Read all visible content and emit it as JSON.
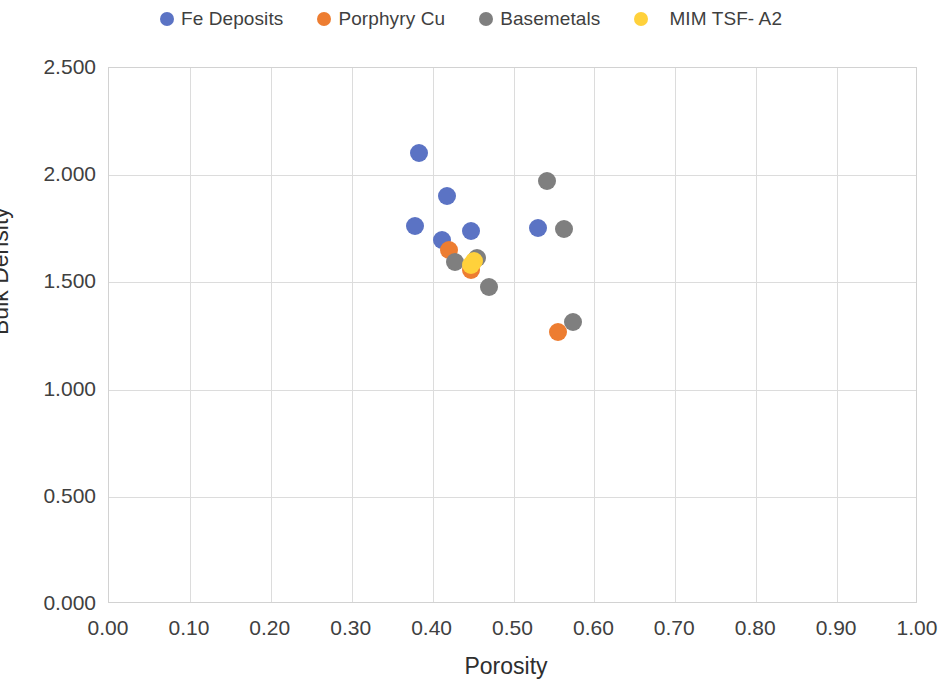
{
  "chart_data": {
    "type": "scatter",
    "title": "",
    "xlabel": "Porosity",
    "ylabel": "Bulk Density",
    "xlim": [
      0.0,
      1.0
    ],
    "ylim": [
      0.0,
      2.5
    ],
    "xticks": [
      "0.00",
      "0.10",
      "0.20",
      "0.30",
      "0.40",
      "0.50",
      "0.60",
      "0.70",
      "0.80",
      "0.90",
      "1.00"
    ],
    "yticks": [
      "0.000",
      "0.500",
      "1.000",
      "1.500",
      "2.000",
      "2.500"
    ],
    "xtick_values": [
      0.0,
      0.1,
      0.2,
      0.3,
      0.4,
      0.5,
      0.6,
      0.7,
      0.8,
      0.9,
      1.0
    ],
    "ytick_values": [
      0.0,
      0.5,
      1.0,
      1.5,
      2.0,
      2.5
    ],
    "grid": true,
    "legend_position": "top",
    "marker_size_px": 18,
    "series": [
      {
        "name": "Fe Deposits",
        "color": "#5B73C4",
        "points": [
          {
            "x": 0.383,
            "y": 2.105
          },
          {
            "x": 0.418,
            "y": 1.905
          },
          {
            "x": 0.378,
            "y": 1.765
          },
          {
            "x": 0.448,
            "y": 1.74
          },
          {
            "x": 0.412,
            "y": 1.7
          },
          {
            "x": 0.53,
            "y": 1.755
          }
        ]
      },
      {
        "name": "Porphyry Cu",
        "color": "#ED7D31",
        "points": [
          {
            "x": 0.42,
            "y": 1.65
          },
          {
            "x": 0.448,
            "y": 1.56
          },
          {
            "x": 0.555,
            "y": 1.27
          }
        ]
      },
      {
        "name": "Basemetals",
        "color": "#7F7F7F",
        "points": [
          {
            "x": 0.542,
            "y": 1.975
          },
          {
            "x": 0.562,
            "y": 1.75
          },
          {
            "x": 0.428,
            "y": 1.595
          },
          {
            "x": 0.455,
            "y": 1.615
          },
          {
            "x": 0.47,
            "y": 1.48
          },
          {
            "x": 0.574,
            "y": 1.315
          }
        ]
      },
      {
        "name": "MIM TSF- A2",
        "color": "#FFD13B",
        "points": [
          {
            "x": 0.451,
            "y": 1.6
          },
          {
            "x": 0.447,
            "y": 1.58
          }
        ]
      }
    ]
  },
  "legend": {
    "items": [
      {
        "label": "Fe Deposits",
        "color": "#5B73C4"
      },
      {
        "label": "Porphyry Cu",
        "color": "#ED7D31"
      },
      {
        "label": "Basemetals",
        "color": "#7F7F7F"
      },
      {
        "label": "MIM TSF- A2",
        "color": "#FFD13B"
      }
    ]
  }
}
